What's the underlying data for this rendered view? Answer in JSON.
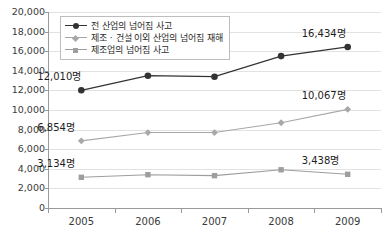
{
  "chart_data": {
    "type": "line",
    "title": "",
    "subtitle": "",
    "xlabel": "",
    "ylabel": "",
    "categories": [
      "2005",
      "2006",
      "2007",
      "2008",
      "2009"
    ],
    "ylim": [
      0,
      20000
    ],
    "ytick_step": 2000,
    "yticks": [
      "0",
      "2,000",
      "4,000",
      "6,000",
      "8,000",
      "10,000",
      "12,000",
      "14,000",
      "16,000",
      "18,000",
      "20,000"
    ],
    "grid": true,
    "grid_axis": "y",
    "legend_position": "top-left-inside",
    "series": [
      {
        "name": "전 산업의 넘어짐 사고",
        "color": "#333333",
        "marker": "circle",
        "values": [
          12010,
          13500,
          13400,
          15500,
          16434
        ],
        "point_labels": [
          {
            "index": 0,
            "text": "12,010명"
          },
          {
            "index": 4,
            "text": "16,434명"
          }
        ]
      },
      {
        "name": "제조 · 건설 이외 산업의 넘어짐 재해",
        "color": "#a8a8a8",
        "marker": "diamond",
        "values": [
          6854,
          7700,
          7700,
          8700,
          10067
        ],
        "point_labels": [
          {
            "index": 0,
            "text": "6,854명"
          },
          {
            "index": 4,
            "text": "10,067명"
          }
        ]
      },
      {
        "name": "제조업의 넘어짐 사고",
        "color": "#9e9e9e",
        "marker": "square",
        "values": [
          3134,
          3400,
          3300,
          3900,
          3438
        ],
        "point_labels": [
          {
            "index": 0,
            "text": "3,134명"
          },
          {
            "index": 4,
            "text": "3,438명"
          }
        ]
      }
    ]
  },
  "colors": {
    "series1": "#333333",
    "series2": "#a8a8a8",
    "series3": "#9e9e9e",
    "grid": "#e2e2e2",
    "axis": "#9a9a9a",
    "text": "#3a3a3a",
    "background": "#ffffff"
  }
}
